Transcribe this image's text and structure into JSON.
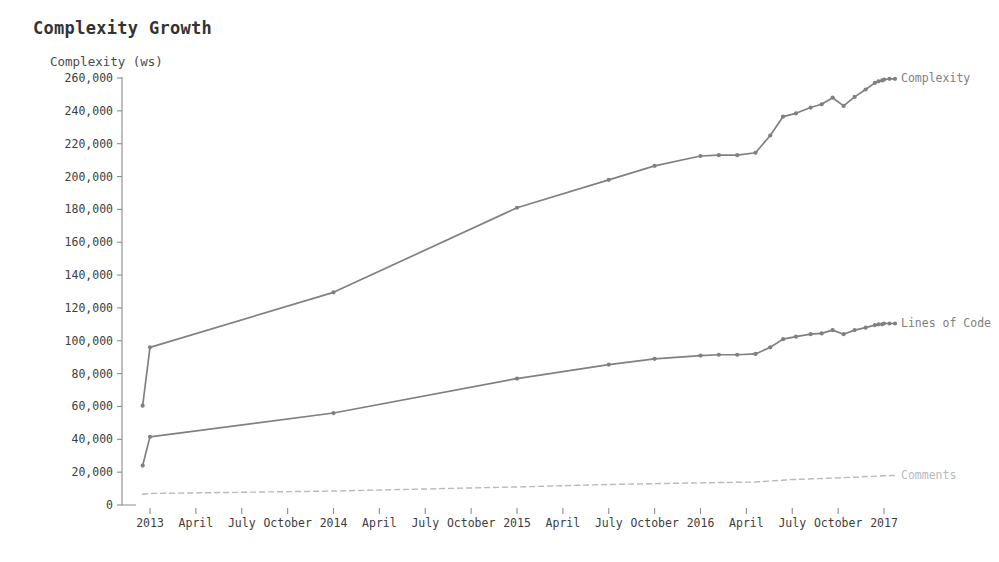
{
  "chart_data": {
    "type": "line",
    "title": "Complexity Growth",
    "ylabel": "Complexity (ws)",
    "xlabel": "",
    "grid": false,
    "legend_position": "right-of-line-end",
    "ylim": [
      0,
      260000
    ],
    "ytick_step": 20000,
    "ytick_labels": [
      "0",
      "20,000",
      "40,000",
      "60,000",
      "80,000",
      "100,000",
      "120,000",
      "140,000",
      "160,000",
      "180,000",
      "200,000",
      "220,000",
      "240,000",
      "260,000"
    ],
    "ytick_values": [
      0,
      20000,
      40000,
      60000,
      80000,
      100000,
      120000,
      140000,
      160000,
      180000,
      200000,
      220000,
      240000,
      260000
    ],
    "xtick_labels": [
      "2013",
      "April",
      "July",
      "October",
      "2014",
      "April",
      "July",
      "October",
      "2015",
      "April",
      "July",
      "October",
      "2016",
      "April",
      "July",
      "October",
      "2017"
    ],
    "x": [
      0,
      0.25,
      0.5,
      0.75,
      1,
      1.25,
      1.5,
      1.75,
      2,
      2.25,
      2.5,
      2.75,
      3,
      3.25,
      3.5,
      3.75,
      4
    ],
    "series": [
      {
        "name": "Complexity",
        "label": "Complexity",
        "color": "#808080",
        "style": "solid",
        "markers": true,
        "points": [
          [
            -0.04,
            60500
          ],
          [
            0.0,
            96000
          ],
          [
            1.0,
            129500
          ],
          [
            2.0,
            181000
          ],
          [
            2.5,
            198000
          ],
          [
            2.75,
            206500
          ],
          [
            3.0,
            212500
          ],
          [
            3.1,
            213000
          ],
          [
            3.2,
            213000
          ],
          [
            3.3,
            214500
          ],
          [
            3.38,
            225000
          ],
          [
            3.45,
            236500
          ],
          [
            3.52,
            238500
          ],
          [
            3.6,
            242000
          ],
          [
            3.66,
            244000
          ],
          [
            3.72,
            248000
          ],
          [
            3.78,
            243000
          ],
          [
            3.84,
            248500
          ],
          [
            3.9,
            253000
          ],
          [
            3.95,
            257000
          ],
          [
            3.97,
            258000
          ],
          [
            3.99,
            258500
          ],
          [
            4.0,
            259000
          ],
          [
            4.03,
            259500
          ],
          [
            4.06,
            259500
          ]
        ]
      },
      {
        "name": "Lines of Code",
        "label": "Lines of Code",
        "color": "#808080",
        "style": "solid",
        "markers": true,
        "points": [
          [
            -0.04,
            24000
          ],
          [
            0.0,
            41500
          ],
          [
            1.0,
            56000
          ],
          [
            2.0,
            77000
          ],
          [
            2.5,
            85500
          ],
          [
            2.75,
            89000
          ],
          [
            3.0,
            91000
          ],
          [
            3.1,
            91500
          ],
          [
            3.2,
            91500
          ],
          [
            3.3,
            92000
          ],
          [
            3.38,
            96000
          ],
          [
            3.45,
            101000
          ],
          [
            3.52,
            102500
          ],
          [
            3.6,
            104000
          ],
          [
            3.66,
            104500
          ],
          [
            3.72,
            106500
          ],
          [
            3.78,
            104000
          ],
          [
            3.84,
            106500
          ],
          [
            3.9,
            108000
          ],
          [
            3.95,
            109500
          ],
          [
            3.97,
            110000
          ],
          [
            3.99,
            110000
          ],
          [
            4.0,
            110500
          ],
          [
            4.03,
            110500
          ],
          [
            4.06,
            110500
          ]
        ]
      },
      {
        "name": "Comments",
        "label": "Comments",
        "color": "#b8b8c0",
        "style": "dashed",
        "markers": false,
        "points": [
          [
            -0.04,
            6500
          ],
          [
            0.0,
            7000
          ],
          [
            1.0,
            8500
          ],
          [
            2.0,
            11000
          ],
          [
            2.5,
            12500
          ],
          [
            3.0,
            13500
          ],
          [
            3.3,
            14000
          ],
          [
            3.5,
            15500
          ],
          [
            3.75,
            16500
          ],
          [
            4.0,
            17800
          ],
          [
            4.06,
            18000
          ]
        ]
      }
    ]
  }
}
